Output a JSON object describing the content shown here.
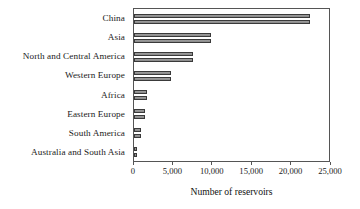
{
  "chart_data": {
    "type": "bar",
    "orientation": "horizontal",
    "title": "",
    "xlabel": "Number of reservoirs",
    "ylabel": "",
    "xlim": [
      0,
      25000
    ],
    "ylim": null,
    "grid": false,
    "legend": null,
    "xticks": [
      0,
      5000,
      10000,
      15000,
      20000,
      25000
    ],
    "xticklabels": [
      "0",
      "5,000",
      "10,000",
      "15,000",
      "20,000",
      "25,000"
    ],
    "categories": [
      "China",
      "Asia",
      "North and Central America",
      "Western Europe",
      "Africa",
      "Eastern Europe",
      "South America",
      "Australia and South Asia"
    ],
    "series": [
      {
        "name": "series-1",
        "values": [
          22600,
          9900,
          7500,
          4700,
          1700,
          1400,
          900,
          400
        ]
      },
      {
        "name": "series-2",
        "values": [
          22600,
          9900,
          7500,
          4700,
          1700,
          1400,
          900,
          400
        ]
      }
    ],
    "bar_color": "#8a8a8a",
    "bar_edge_color": "#3a3a3a",
    "axis_color": "#555555"
  }
}
